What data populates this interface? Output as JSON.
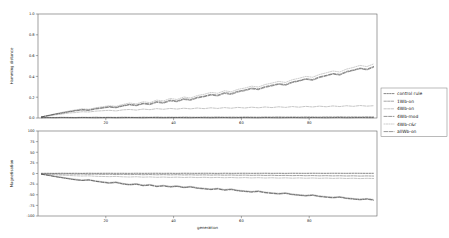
{
  "figure": {
    "background": "#ffffff",
    "width": 449,
    "height": 238
  },
  "legend": {
    "position": "right",
    "entries": [
      {
        "label": "control rule",
        "color": "#111111",
        "dash": "1.6,1.2"
      },
      {
        "label": "1Wb-on",
        "color": "#4a4a4a",
        "dash": "2.4,1.2"
      },
      {
        "label": "4Wb-on",
        "color": "#8a8a8a",
        "dash": "2.4,1.2"
      },
      {
        "label": "4Wb-mod",
        "color": "#2b2b2b",
        "dash": "3.2,1.4"
      },
      {
        "label": "4Wb-c&r",
        "color": "#9a9a9a",
        "dash": "1.2,1.2"
      },
      {
        "label": "allWb-on",
        "color": "#333333",
        "dash": "3.6,1.4"
      }
    ]
  },
  "chart_data": [
    {
      "type": "line",
      "id": "hamming-distance-panel",
      "title": "",
      "xlabel": "",
      "ylabel": "Hamming distance",
      "xlim": [
        0,
        100
      ],
      "ylim": [
        0.0,
        1.0
      ],
      "xticks": [
        20,
        40,
        60,
        80
      ],
      "xticklabels": [
        "20",
        "40",
        "60",
        "80"
      ],
      "yticks": [
        0.0,
        0.2,
        0.4,
        0.6,
        0.8,
        1.0
      ],
      "yticklabels": [
        "0.0",
        "0.2",
        "0.4",
        "0.6",
        "0.8",
        "1.0"
      ],
      "grid": false,
      "x": [
        1,
        3,
        5,
        7,
        9,
        11,
        13,
        15,
        17,
        19,
        21,
        23,
        25,
        27,
        29,
        31,
        33,
        35,
        37,
        39,
        41,
        43,
        45,
        47,
        49,
        51,
        53,
        55,
        57,
        59,
        61,
        63,
        65,
        67,
        69,
        71,
        73,
        75,
        77,
        79,
        81,
        83,
        85,
        87,
        89,
        91,
        93,
        95,
        97,
        99
      ],
      "series": [
        {
          "name": "control rule",
          "color": "#111111",
          "dash": "1.6,1.2",
          "values": [
            0.003,
            0.004,
            0.003,
            0.005,
            0.004,
            0.003,
            0.005,
            0.004,
            0.003,
            0.004,
            0.005,
            0.003,
            0.004,
            0.005,
            0.004,
            0.003,
            0.005,
            0.004,
            0.003,
            0.004,
            0.005,
            0.004,
            0.003,
            0.005,
            0.004,
            0.003,
            0.004,
            0.005,
            0.003,
            0.004,
            0.005,
            0.004,
            0.003,
            0.005,
            0.004,
            0.003,
            0.004,
            0.005,
            0.004,
            0.003,
            0.005,
            0.004,
            0.003,
            0.004,
            0.005,
            0.003,
            0.004,
            0.005,
            0.004,
            0.004
          ]
        },
        {
          "name": "1Wb-on",
          "color": "#4a4a4a",
          "dash": "2.4,1.2",
          "values": [
            0.004,
            0.006,
            0.005,
            0.007,
            0.006,
            0.005,
            0.007,
            0.006,
            0.008,
            0.006,
            0.007,
            0.006,
            0.008,
            0.007,
            0.006,
            0.008,
            0.007,
            0.009,
            0.007,
            0.008,
            0.007,
            0.009,
            0.008,
            0.007,
            0.009,
            0.008,
            0.01,
            0.008,
            0.009,
            0.008,
            0.01,
            0.009,
            0.008,
            0.01,
            0.009,
            0.011,
            0.009,
            0.01,
            0.009,
            0.011,
            0.01,
            0.009,
            0.011,
            0.01,
            0.012,
            0.01,
            0.011,
            0.01,
            0.012,
            0.011
          ]
        },
        {
          "name": "4Wb-on",
          "color": "#8a8a8a",
          "dash": "2.4,1.2",
          "values": [
            0.012,
            0.02,
            0.03,
            0.038,
            0.048,
            0.052,
            0.06,
            0.058,
            0.066,
            0.07,
            0.074,
            0.068,
            0.078,
            0.082,
            0.076,
            0.086,
            0.08,
            0.09,
            0.084,
            0.092,
            0.086,
            0.094,
            0.088,
            0.096,
            0.09,
            0.098,
            0.092,
            0.1,
            0.094,
            0.102,
            0.096,
            0.104,
            0.098,
            0.106,
            0.1,
            0.108,
            0.102,
            0.11,
            0.104,
            0.112,
            0.106,
            0.114,
            0.108,
            0.116,
            0.11,
            0.118,
            0.112,
            0.12,
            0.114,
            0.118
          ]
        },
        {
          "name": "4Wb-mod",
          "color": "#2b2b2b",
          "dash": "3.2,1.4",
          "values": [
            0.01,
            0.024,
            0.038,
            0.05,
            0.062,
            0.072,
            0.082,
            0.078,
            0.092,
            0.1,
            0.11,
            0.104,
            0.12,
            0.132,
            0.124,
            0.142,
            0.136,
            0.158,
            0.15,
            0.172,
            0.164,
            0.186,
            0.178,
            0.2,
            0.21,
            0.228,
            0.22,
            0.244,
            0.236,
            0.258,
            0.27,
            0.288,
            0.28,
            0.302,
            0.316,
            0.33,
            0.322,
            0.348,
            0.36,
            0.378,
            0.37,
            0.396,
            0.41,
            0.428,
            0.42,
            0.448,
            0.462,
            0.48,
            0.47,
            0.496
          ]
        },
        {
          "name": "4Wb-c&r",
          "color": "#9a9a9a",
          "dash": "1.2,1.2",
          "values": [
            0.012,
            0.026,
            0.04,
            0.054,
            0.066,
            0.078,
            0.088,
            0.084,
            0.098,
            0.108,
            0.118,
            0.112,
            0.13,
            0.144,
            0.136,
            0.156,
            0.148,
            0.172,
            0.164,
            0.188,
            0.178,
            0.202,
            0.192,
            0.216,
            0.228,
            0.246,
            0.238,
            0.262,
            0.252,
            0.276,
            0.288,
            0.306,
            0.298,
            0.322,
            0.336,
            0.352,
            0.342,
            0.368,
            0.382,
            0.4,
            0.392,
            0.418,
            0.434,
            0.452,
            0.442,
            0.47,
            0.486,
            0.506,
            0.494,
            0.52
          ]
        },
        {
          "name": "allWb-on",
          "color": "#333333",
          "dash": "3.6,1.4",
          "values": [
            0.011,
            0.022,
            0.036,
            0.046,
            0.058,
            0.068,
            0.076,
            0.072,
            0.086,
            0.094,
            0.104,
            0.098,
            0.114,
            0.126,
            0.118,
            0.136,
            0.128,
            0.15,
            0.142,
            0.164,
            0.156,
            0.178,
            0.17,
            0.192,
            0.204,
            0.22,
            0.212,
            0.236,
            0.226,
            0.25,
            0.262,
            0.28,
            0.272,
            0.294,
            0.308,
            0.324,
            0.314,
            0.34,
            0.354,
            0.372,
            0.362,
            0.388,
            0.404,
            0.422,
            0.412,
            0.44,
            0.456,
            0.474,
            0.462,
            0.488
          ]
        }
      ]
    },
    {
      "type": "line",
      "id": "magnetisation-panel",
      "title": "",
      "xlabel": "generation",
      "ylabel": "Magnetisation",
      "xlim": [
        0,
        100
      ],
      "ylim": [
        -100,
        100
      ],
      "xticks": [
        20,
        40,
        60,
        80
      ],
      "xticklabels": [
        "20",
        "40",
        "60",
        "80"
      ],
      "yticks": [
        -100,
        -75,
        -50,
        -25,
        0,
        25,
        50,
        75,
        100
      ],
      "yticklabels": [
        "-100",
        "-75",
        "-50",
        "-25",
        "0",
        "25",
        "50",
        "75",
        "100"
      ],
      "grid": false,
      "x": [
        1,
        3,
        5,
        7,
        9,
        11,
        13,
        15,
        17,
        19,
        21,
        23,
        25,
        27,
        29,
        31,
        33,
        35,
        37,
        39,
        41,
        43,
        45,
        47,
        49,
        51,
        53,
        55,
        57,
        59,
        61,
        63,
        65,
        67,
        69,
        71,
        73,
        75,
        77,
        79,
        81,
        83,
        85,
        87,
        89,
        91,
        93,
        95,
        97,
        99
      ],
      "series": [
        {
          "name": "control rule",
          "color": "#111111",
          "dash": "1.6,1.2",
          "values": [
            0.4,
            0.5,
            0.3,
            0.6,
            0.4,
            0.5,
            0.3,
            0.6,
            0.4,
            0.5,
            0.6,
            0.4,
            0.5,
            0.3,
            0.6,
            0.4,
            0.5,
            0.6,
            0.4,
            0.5,
            0.3,
            0.6,
            0.5,
            0.4,
            0.6,
            0.5,
            0.3,
            0.6,
            0.4,
            0.5,
            0.6,
            0.4,
            0.5,
            0.6,
            0.4,
            0.5,
            0.3,
            0.6,
            0.5,
            0.4,
            0.6,
            0.5,
            0.4,
            0.6,
            0.5,
            0.4,
            0.6,
            0.5,
            0.4,
            0.5
          ]
        },
        {
          "name": "1Wb-on",
          "color": "#4a4a4a",
          "dash": "2.4,1.2",
          "values": [
            -0.6,
            -1.0,
            -0.8,
            -1.4,
            -1.1,
            -1.6,
            -1.3,
            -1.9,
            -1.5,
            -2.1,
            -1.8,
            -2.4,
            -2.0,
            -2.6,
            -2.2,
            -2.8,
            -2.4,
            -3.0,
            -2.6,
            -3.2,
            -2.8,
            -3.4,
            -3.0,
            -3.6,
            -3.2,
            -3.8,
            -3.4,
            -4.0,
            -3.6,
            -4.2,
            -3.8,
            -4.4,
            -4.0,
            -4.6,
            -4.2,
            -4.8,
            -4.4,
            -5.0,
            -4.6,
            -5.2,
            -4.8,
            -5.4,
            -5.0,
            -5.6,
            -5.2,
            -5.8,
            -5.4,
            -6.0,
            -5.6,
            -6.0
          ]
        },
        {
          "name": "4Wb-on",
          "color": "#8a8a8a",
          "dash": "2.4,1.2",
          "values": [
            -1.0,
            -2.0,
            -3.0,
            -4.0,
            -4.6,
            -5.4,
            -6.0,
            -5.6,
            -6.6,
            -7.0,
            -7.4,
            -6.8,
            -7.8,
            -8.2,
            -7.6,
            -8.6,
            -8.0,
            -9.0,
            -8.4,
            -9.2,
            -8.6,
            -9.4,
            -8.8,
            -9.6,
            -9.0,
            -9.8,
            -9.2,
            -10.0,
            -9.4,
            -10.2,
            -9.6,
            -10.4,
            -9.8,
            -10.6,
            -10.0,
            -10.8,
            -10.2,
            -11.0,
            -10.4,
            -11.2,
            -10.6,
            -11.4,
            -10.8,
            -11.6,
            -11.0,
            -11.8,
            -11.2,
            -12.0,
            -11.4,
            -11.8
          ]
        },
        {
          "name": "4Wb-mod",
          "color": "#2b2b2b",
          "dash": "3.2,1.4",
          "values": [
            -1.5,
            -4.0,
            -7.0,
            -9.5,
            -12.0,
            -14.5,
            -16.0,
            -15.0,
            -18.0,
            -20.0,
            -22.0,
            -20.5,
            -24.0,
            -26.0,
            -24.5,
            -28.0,
            -26.5,
            -30.0,
            -28.5,
            -31.0,
            -29.5,
            -32.5,
            -31.0,
            -34.0,
            -35.5,
            -37.0,
            -35.5,
            -38.5,
            -37.0,
            -40.0,
            -41.5,
            -43.0,
            -41.5,
            -44.5,
            -46.0,
            -47.5,
            -46.0,
            -49.0,
            -50.5,
            -52.0,
            -50.5,
            -53.5,
            -55.0,
            -56.5,
            -55.0,
            -58.0,
            -59.5,
            -61.0,
            -59.5,
            -62.0
          ]
        },
        {
          "name": "4Wb-c&r",
          "color": "#9a9a9a",
          "dash": "1.2,1.2",
          "values": [
            -1.2,
            -3.5,
            -6.0,
            -8.5,
            -11.0,
            -13.0,
            -15.0,
            -14.0,
            -17.0,
            -19.0,
            -21.0,
            -19.5,
            -23.0,
            -25.0,
            -23.5,
            -27.0,
            -25.5,
            -29.0,
            -27.5,
            -30.0,
            -28.5,
            -31.5,
            -30.0,
            -33.0,
            -34.5,
            -36.0,
            -34.5,
            -37.5,
            -36.0,
            -39.0,
            -40.5,
            -42.0,
            -40.5,
            -43.5,
            -45.0,
            -46.5,
            -45.0,
            -48.0,
            -49.5,
            -51.0,
            -49.5,
            -52.5,
            -54.0,
            -55.5,
            -54.0,
            -57.0,
            -58.5,
            -60.0,
            -58.5,
            -61.0
          ]
        },
        {
          "name": "allWb-on",
          "color": "#333333",
          "dash": "3.6,1.4",
          "values": [
            -1.8,
            -4.5,
            -7.5,
            -10.0,
            -12.5,
            -15.0,
            -16.5,
            -15.5,
            -18.5,
            -21.0,
            -23.0,
            -21.5,
            -25.0,
            -27.0,
            -25.5,
            -29.0,
            -27.5,
            -31.0,
            -29.5,
            -32.0,
            -30.5,
            -33.5,
            -32.0,
            -35.0,
            -36.5,
            -38.0,
            -36.5,
            -39.5,
            -38.0,
            -41.0,
            -42.5,
            -44.0,
            -42.5,
            -45.5,
            -47.0,
            -48.5,
            -47.0,
            -50.0,
            -51.5,
            -53.0,
            -51.5,
            -54.5,
            -56.0,
            -57.5,
            -56.0,
            -59.0,
            -60.5,
            -62.0,
            -60.5,
            -63.0
          ]
        }
      ]
    }
  ]
}
